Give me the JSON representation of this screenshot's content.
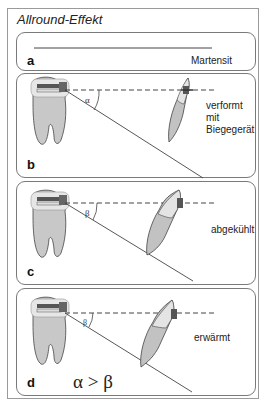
{
  "figure": {
    "title": "Allround-Effekt",
    "panels": [
      {
        "label": "a",
        "note": "Martensit"
      },
      {
        "label": "b",
        "note_line1": "verformt mit",
        "note_line2": "Biegegerät",
        "angle_symbol": "α"
      },
      {
        "label": "c",
        "note": "abgekühlt",
        "angle_symbol": "β"
      },
      {
        "label": "d",
        "note": "erwärmt",
        "angle_symbol": "β",
        "inequality": "α > β"
      }
    ]
  }
}
